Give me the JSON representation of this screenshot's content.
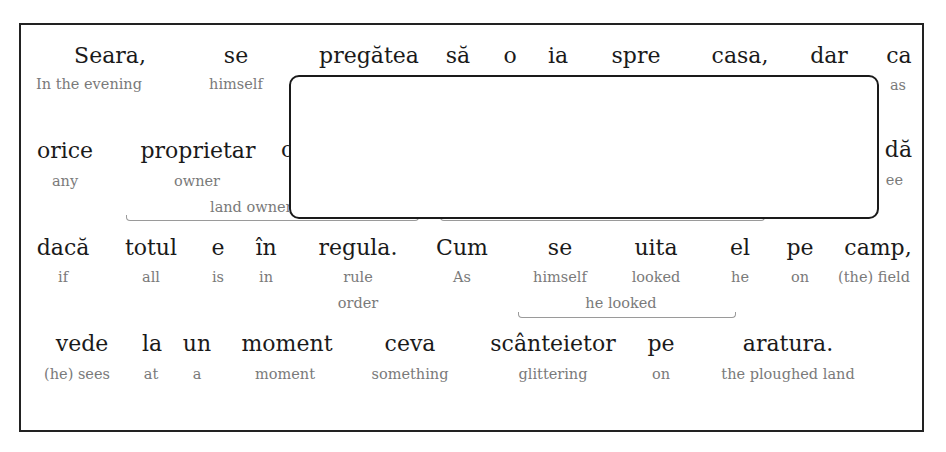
{
  "passage": {
    "lines": [
      {
        "words": [
          {
            "ro": "Seara,",
            "en": "In the evening"
          },
          {
            "ro": "se",
            "en": "himself"
          },
          {
            "ro": "pregătea",
            "en": ""
          },
          {
            "ro": "să",
            "en": ""
          },
          {
            "ro": "o",
            "en": ""
          },
          {
            "ro": "ia",
            "en": ""
          },
          {
            "ro": "spre",
            "en": ""
          },
          {
            "ro": "casa,",
            "en": ""
          },
          {
            "ro": "dar",
            "en": ""
          },
          {
            "ro": "ca",
            "en": "as"
          }
        ]
      },
      {
        "words": [
          {
            "ro": "orice",
            "en": "any"
          },
          {
            "ro": "proprietar",
            "en": "owner"
          },
          {
            "ro": "o",
            "en": ""
          },
          {
            "ro": "dă",
            "en": "ee"
          }
        ],
        "phrase_glosses": [
          {
            "text": "land owner",
            "covers": "proprietar …"
          },
          {
            "text": "",
            "covers": "…"
          }
        ]
      },
      {
        "words": [
          {
            "ro": "dacă",
            "en": "if"
          },
          {
            "ro": "totul",
            "en": "all"
          },
          {
            "ro": "e",
            "en": "is"
          },
          {
            "ro": "în",
            "en": "in"
          },
          {
            "ro": "regula.",
            "en": "rule",
            "en2": "order"
          },
          {
            "ro": "Cum",
            "en": "As"
          },
          {
            "ro": "se",
            "en": "himself"
          },
          {
            "ro": "uita",
            "en": "looked"
          },
          {
            "ro": "el",
            "en": "he"
          },
          {
            "ro": "pe",
            "en": "on"
          },
          {
            "ro": "camp,",
            "en": "(the) field"
          }
        ],
        "phrase_glosses": [
          {
            "text": "he looked",
            "covers": "se uita"
          }
        ]
      },
      {
        "words": [
          {
            "ro": "vede",
            "en": "(he) sees"
          },
          {
            "ro": "la",
            "en": "at"
          },
          {
            "ro": "un",
            "en": "a"
          },
          {
            "ro": "moment",
            "en": "moment"
          },
          {
            "ro": "ceva",
            "en": "something"
          },
          {
            "ro": "scânteietor",
            "en": "glittering"
          },
          {
            "ro": "pe",
            "en": "on"
          },
          {
            "ro": "aratura.",
            "en": "the ploughed land"
          }
        ]
      }
    ]
  },
  "overlay": {
    "content": ""
  },
  "colors": {
    "text": "#1a1a1a",
    "gloss": "#7a7a7a",
    "border": "#222222",
    "bracket": "#9a9a9a"
  }
}
